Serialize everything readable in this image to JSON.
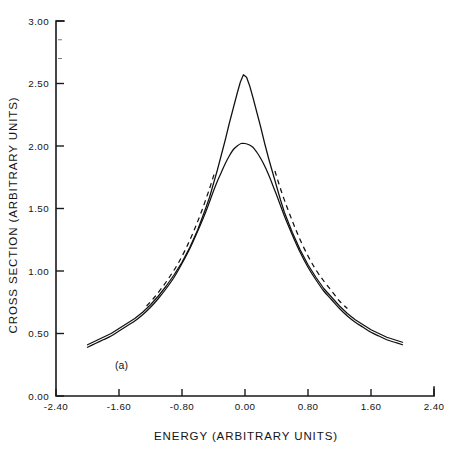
{
  "figure": {
    "panel_label": "(a)",
    "background_color": "#ffffff",
    "ink_color": "#111111"
  },
  "chart_data": {
    "type": "line",
    "title": "",
    "subtitle": "",
    "xlabel": "ENERGY (ARBITRARY UNITS)",
    "ylabel": "CROSS SECTION (ARBITRARY UNITS)",
    "xlim": [
      -2.4,
      2.4
    ],
    "ylim": [
      0.0,
      3.0
    ],
    "xticks": [
      -2.4,
      -1.6,
      -0.8,
      0.0,
      0.8,
      1.6,
      2.4
    ],
    "xticklabels": [
      "-2.40",
      "-1.60",
      "-0.80",
      "0.00",
      "0.80",
      "1.60",
      "2.40"
    ],
    "yticks": [
      0.0,
      0.5,
      1.0,
      1.5,
      2.0,
      2.5,
      3.0
    ],
    "yticklabels": [
      "0.00",
      "0.50",
      "1.00",
      "1.50",
      "2.00",
      "2.50",
      "3.00"
    ],
    "grid": false,
    "legend": false,
    "legend_position": "none",
    "annotations": [
      {
        "text": "(a)",
        "x": -1.65,
        "y": 0.22
      }
    ],
    "series": [
      {
        "name": "cusped-peak",
        "style": "solid",
        "x": [
          -2.0,
          -1.9,
          -1.8,
          -1.7,
          -1.6,
          -1.5,
          -1.4,
          -1.3,
          -1.2,
          -1.1,
          -1.0,
          -0.9,
          -0.8,
          -0.7,
          -0.6,
          -0.5,
          -0.45,
          -0.4,
          -0.35,
          -0.3,
          -0.25,
          -0.2,
          -0.15,
          -0.1,
          -0.06,
          -0.02,
          0.02,
          0.06,
          0.1,
          0.15,
          0.2,
          0.25,
          0.3,
          0.35,
          0.4,
          0.45,
          0.5,
          0.6,
          0.7,
          0.8,
          0.9,
          1.0,
          1.1,
          1.2,
          1.3,
          1.4,
          1.5,
          1.6,
          1.7,
          1.8,
          1.9,
          2.0
        ],
        "y": [
          0.41,
          0.44,
          0.47,
          0.5,
          0.54,
          0.58,
          0.62,
          0.67,
          0.73,
          0.8,
          0.88,
          0.97,
          1.07,
          1.19,
          1.33,
          1.5,
          1.59,
          1.7,
          1.81,
          1.93,
          2.05,
          2.18,
          2.3,
          2.42,
          2.51,
          2.57,
          2.55,
          2.48,
          2.39,
          2.27,
          2.15,
          2.02,
          1.9,
          1.79,
          1.68,
          1.57,
          1.47,
          1.31,
          1.17,
          1.05,
          0.95,
          0.86,
          0.79,
          0.72,
          0.66,
          0.61,
          0.57,
          0.53,
          0.5,
          0.47,
          0.45,
          0.43
        ]
      },
      {
        "name": "rounded-peak",
        "style": "solid",
        "x": [
          -2.0,
          -1.9,
          -1.8,
          -1.7,
          -1.6,
          -1.5,
          -1.4,
          -1.3,
          -1.2,
          -1.1,
          -1.0,
          -0.9,
          -0.8,
          -0.7,
          -0.6,
          -0.5,
          -0.4,
          -0.35,
          -0.3,
          -0.25,
          -0.2,
          -0.15,
          -0.1,
          -0.05,
          0.0,
          0.05,
          0.1,
          0.15,
          0.2,
          0.25,
          0.3,
          0.35,
          0.4,
          0.5,
          0.6,
          0.7,
          0.8,
          0.9,
          1.0,
          1.1,
          1.2,
          1.3,
          1.4,
          1.5,
          1.6,
          1.7,
          1.8,
          1.9,
          2.0
        ],
        "y": [
          0.39,
          0.42,
          0.45,
          0.48,
          0.52,
          0.56,
          0.6,
          0.65,
          0.71,
          0.78,
          0.86,
          0.95,
          1.06,
          1.18,
          1.32,
          1.47,
          1.64,
          1.72,
          1.79,
          1.86,
          1.92,
          1.97,
          2.0,
          2.02,
          2.02,
          2.01,
          1.99,
          1.95,
          1.9,
          1.84,
          1.77,
          1.69,
          1.61,
          1.44,
          1.29,
          1.15,
          1.03,
          0.93,
          0.84,
          0.77,
          0.7,
          0.64,
          0.59,
          0.55,
          0.51,
          0.48,
          0.45,
          0.43,
          0.41
        ]
      },
      {
        "name": "dashed-flank-left",
        "style": "dashed",
        "x": [
          -1.25,
          -1.15,
          -1.05,
          -0.95,
          -0.85,
          -0.75,
          -0.65,
          -0.55,
          -0.45,
          -0.38
        ],
        "y": [
          0.72,
          0.79,
          0.87,
          0.96,
          1.06,
          1.18,
          1.32,
          1.48,
          1.66,
          1.8
        ]
      },
      {
        "name": "dashed-flank-right",
        "style": "dashed",
        "x": [
          0.38,
          0.46,
          0.54,
          0.62,
          0.7,
          0.8,
          0.9,
          1.0,
          1.1,
          1.2,
          1.3
        ],
        "y": [
          1.8,
          1.64,
          1.5,
          1.37,
          1.25,
          1.12,
          1.01,
          0.92,
          0.84,
          0.76,
          0.7
        ]
      }
    ]
  }
}
